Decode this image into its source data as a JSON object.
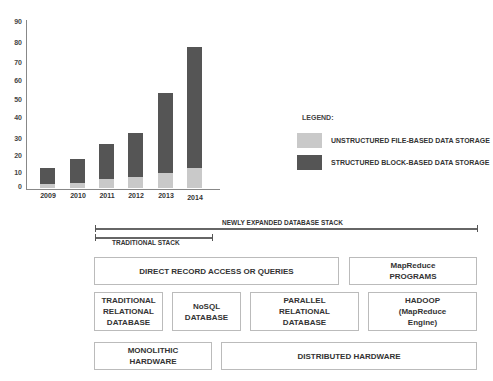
{
  "chart_data": {
    "type": "bar",
    "stacked": true,
    "title": "",
    "xlabel": "",
    "ylabel": "",
    "categories": [
      "2009",
      "2010",
      "2011",
      "2012",
      "2013",
      "2014"
    ],
    "series": [
      {
        "name": "UNSTRUCTURED FILE-BASED DATA STORAGE",
        "color": "#c9c9c9",
        "values": [
          2,
          3,
          5,
          6,
          8,
          11
        ]
      },
      {
        "name": "STRUCTURED BLOCK-BASED DATA STORAGE",
        "color": "#555555",
        "values": [
          9,
          13,
          19,
          24,
          44,
          66
        ]
      }
    ],
    "totals": [
      11,
      16,
      24,
      30,
      52,
      77
    ],
    "y_ticks": [
      "0",
      "10",
      "20",
      "30",
      "40",
      "50",
      "60",
      "70",
      "80",
      "90"
    ],
    "ylim": [
      0,
      90
    ],
    "grid": false,
    "legend_position": "right"
  },
  "legend": {
    "title": "LEGEND:",
    "items": [
      {
        "label": "UNSTRUCTURED FILE-BASED DATA STORAGE",
        "color": "#c9c9c9"
      },
      {
        "label": "STRUCTURED BLOCK-BASED DATA STORAGE",
        "color": "#555555"
      }
    ]
  },
  "stack_diagram": {
    "newly_expanded_label": "NEWLY EXPANDED DATABASE STACK",
    "traditional_label": "TRADITIONAL STACK",
    "row1": [
      {
        "label": "DIRECT RECORD ACCESS OR QUERIES"
      },
      {
        "label": "MapReduce\nPROGRAMS"
      }
    ],
    "row2": [
      {
        "label": "TRADITIONAL\nRELATIONAL\nDATABASE"
      },
      {
        "label": "NoSQL\nDATABASE"
      },
      {
        "label": "PARALLEL\nRELATIONAL\nDATABASE"
      },
      {
        "label": "HADOOP\n(MapReduce\nEngine)"
      }
    ],
    "row3": [
      {
        "label": "MONOLITHIC\nHARDWARE"
      },
      {
        "label": "DISTRIBUTED HARDWARE"
      }
    ]
  }
}
